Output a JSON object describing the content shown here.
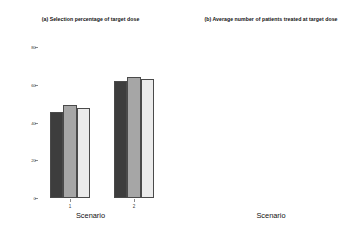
{
  "figure": {
    "width": 361,
    "height": 237,
    "background": "#ffffff"
  },
  "series_colors": [
    "#3d3d3d",
    "#a6a6a6",
    "#ebebeb"
  ],
  "chart_data": [
    {
      "type": "bar",
      "panel": "a",
      "title": "(a) Selection percentage of target dose",
      "xlabel": "Scenario",
      "ylabel": "",
      "categories": [
        "1",
        "2"
      ],
      "series": [
        {
          "name": "Method 1",
          "color": "#3d3d3d",
          "values": [
            45.5,
            62.0
          ]
        },
        {
          "name": "Method 2",
          "color": "#a6a6a6",
          "values": [
            49.5,
            64.0
          ]
        },
        {
          "name": "Method 3",
          "color": "#ebebeb",
          "values": [
            47.5,
            63.0
          ]
        }
      ],
      "ylim": [
        0,
        80
      ],
      "yticks": [
        0,
        20,
        40,
        60,
        80
      ],
      "ytick_labels": [
        "0",
        "20",
        "40",
        "60",
        "80"
      ],
      "grid": false,
      "legend": "none"
    },
    {
      "type": "bar",
      "panel": "b",
      "title": "(b) Average number of patients treated at target dose",
      "xlabel": "Scenario",
      "ylabel": "",
      "categories": [
        "1",
        "2"
      ],
      "series": [
        {
          "name": "Method 1",
          "color": "#3d3d3d",
          "values": [
            19.0,
            23.5
          ]
        },
        {
          "name": "Method 2",
          "color": "#a6a6a6",
          "values": [
            20.4,
            25.0
          ]
        },
        {
          "name": "Method 3",
          "color": "#ebebeb",
          "values": [
            19.9,
            24.5
          ]
        }
      ],
      "ylim": [
        0,
        30
      ],
      "yticks": [
        0,
        5,
        10,
        15,
        20,
        25,
        30
      ],
      "ytick_labels": [
        "0",
        "5",
        "10",
        "15",
        "20",
        "25",
        "30"
      ],
      "grid": false,
      "legend": "none"
    }
  ]
}
